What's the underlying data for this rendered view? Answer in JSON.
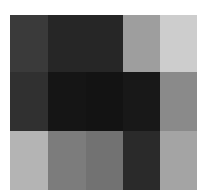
{
  "image": {
    "description": "Grayscale mosaic of 5 columns by 3 rows of uniform blocks",
    "columns": 5,
    "rows": 3,
    "cells": [
      [
        "#3a3a3a",
        "#262626",
        "#262626",
        "#9e9e9e",
        "#cdcdcd"
      ],
      [
        "#303030",
        "#151515",
        "#131313",
        "#181818",
        "#8a8a8a"
      ],
      [
        "#b4b4b4",
        "#7c7c7c",
        "#727272",
        "#2a2a2a",
        "#a4a4a4"
      ]
    ]
  }
}
